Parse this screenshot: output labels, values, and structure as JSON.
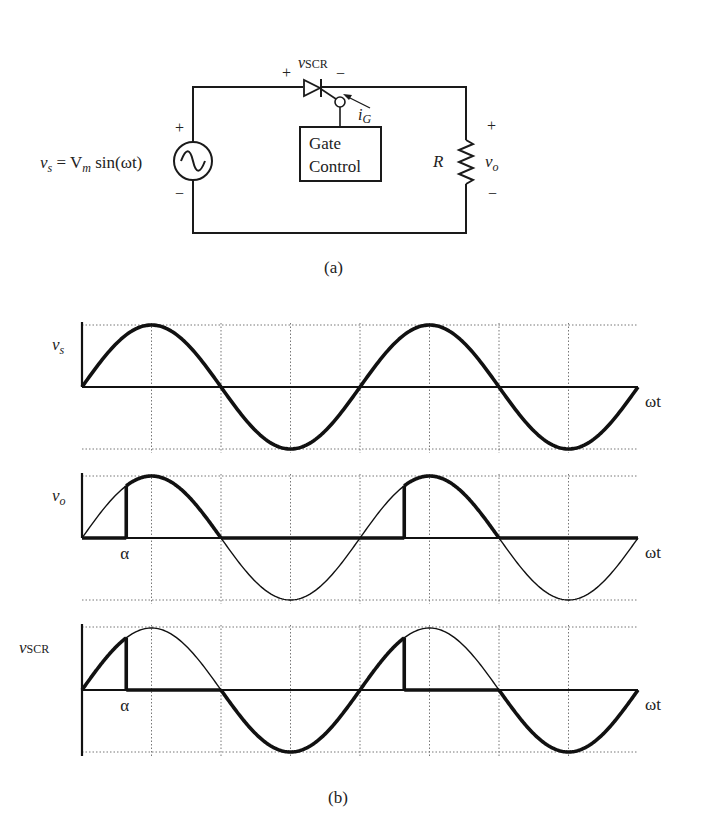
{
  "circuit": {
    "caption": "(a)",
    "source_label": "v",
    "source_label_sub": "s",
    "source_eq": " = V",
    "source_eq_sub": "m",
    "source_eq_tail": " sin(ωt)",
    "source_plus": "+",
    "source_minus": "−",
    "scr_label": "v",
    "scr_label_sub": "SCR",
    "scr_plus": "+",
    "scr_minus": "−",
    "gate_current": "i",
    "gate_current_sub": "G",
    "gate_box_line1": "Gate",
    "gate_box_line2": "Control",
    "resistor_label": "R",
    "output_label": "v",
    "output_label_sub": "o",
    "output_plus": "+",
    "output_minus": "−"
  },
  "waveforms": {
    "caption": "(b)",
    "x_label": "ωt",
    "alpha_label": "α",
    "panels": [
      {
        "label": "v",
        "label_sub": "s",
        "show_alpha": false
      },
      {
        "label": "v",
        "label_sub": "o",
        "show_alpha": true
      },
      {
        "label": "v",
        "label_sub": "SCR",
        "show_alpha": true
      }
    ]
  },
  "chart_data": {
    "type": "line",
    "xlabel": "ωt",
    "x_range_periods": 2,
    "grid_divisions_per_period": 4,
    "firing_angle_label": "α",
    "firing_angle_rad_approx": 1.0,
    "series": [
      {
        "name": "v_s",
        "description": "full sine V_m sin(ωt), shown bold across 0..4π"
      },
      {
        "name": "v_o",
        "description": "0 for 0<ωt<α; equals v_s for α<ωt<π; 0 for π<ωt<2π+α; repeats; v_s drawn thin as reference"
      },
      {
        "name": "v_SCR",
        "description": "equals v_s for 0<ωt<α; 0 for α<ωt<π; equals v_s (negative half) for π<ωt<2π+α; repeats; v_s drawn thin as reference"
      }
    ],
    "grid": true
  }
}
